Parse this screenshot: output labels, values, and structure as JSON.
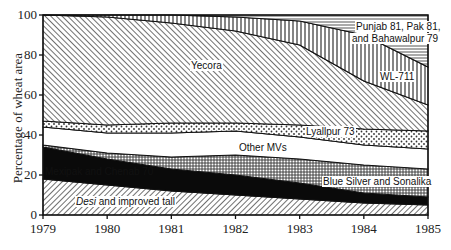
{
  "chart_data": {
    "type": "area",
    "stacked": true,
    "title": "",
    "xlabel": "",
    "ylabel": "Percentage of wheat area",
    "ylim": [
      0,
      100
    ],
    "yticks": [
      0,
      20,
      40,
      60,
      80,
      100
    ],
    "x": [
      1979,
      1980,
      1981,
      1982,
      1983,
      1984,
      1985
    ],
    "series": [
      {
        "name": "Desi and improved tall",
        "values": [
          18,
          15,
          12,
          10,
          8,
          6,
          5
        ],
        "pattern": "hatch-back"
      },
      {
        "name": "Mexipak and Chenab 70",
        "values": [
          16,
          13,
          11,
          10,
          8,
          5,
          4
        ],
        "pattern": "solid-black"
      },
      {
        "name": "Blue Silver and Sonalika",
        "values": [
          1,
          3,
          6,
          10,
          12,
          14,
          14
        ],
        "pattern": "crosshatch"
      },
      {
        "name": "Other MVs",
        "values": [
          9,
          10,
          12,
          12,
          11,
          10,
          10
        ],
        "pattern": "white"
      },
      {
        "name": "Lyallpur 73",
        "values": [
          3,
          4,
          5,
          4,
          6,
          8,
          9
        ],
        "pattern": "dots"
      },
      {
        "name": "Yecora",
        "values": [
          53,
          54,
          50,
          46,
          40,
          24,
          13
        ],
        "pattern": "hatch-fwd"
      },
      {
        "name": "WL-711",
        "values": [
          0,
          1,
          4,
          7,
          12,
          23,
          19
        ],
        "pattern": "vertical"
      },
      {
        "name": "Punjab 81, Pak 81, and Bahawalpur 79",
        "values": [
          0,
          0,
          0,
          1,
          3,
          10,
          26
        ],
        "pattern": "horizontal"
      }
    ],
    "cumulative_tops": {
      "Desi and improved tall": [
        18,
        15,
        12,
        10,
        8,
        6,
        5
      ],
      "Mexipak and Chenab 70": [
        34,
        28,
        23,
        20,
        16,
        11,
        9
      ],
      "Blue Silver and Sonalika": [
        35,
        31,
        29,
        30,
        28,
        25,
        23
      ],
      "Other MVs": [
        44,
        41,
        41,
        42,
        39,
        35,
        33
      ],
      "Lyallpur 73": [
        47,
        45,
        46,
        46,
        45,
        43,
        42
      ],
      "Yecora": [
        100,
        99,
        96,
        92,
        85,
        67,
        55
      ],
      "WL-711": [
        100,
        100,
        100,
        99,
        97,
        90,
        74
      ],
      "Punjab 81, Pak 81, and Bahawalpur 79": [
        100,
        100,
        100,
        100,
        100,
        100,
        100
      ]
    },
    "labels": {
      "desi_italic": "Desi",
      "desi_rest": " and improved tall",
      "mexipak": "Mexipak and Chenab 70",
      "bluesilver": "Blue Silver and Sonalika",
      "othermvs": "Other MVs",
      "lyallpur": "Lyallpur 73",
      "yecora": "Yecora",
      "wl711": "WL-711",
      "punjab_line1": "Punjab 81, Pak 81,",
      "punjab_line2": "and Bahawalpur 79"
    },
    "grid": false,
    "legend": "inline labels"
  }
}
